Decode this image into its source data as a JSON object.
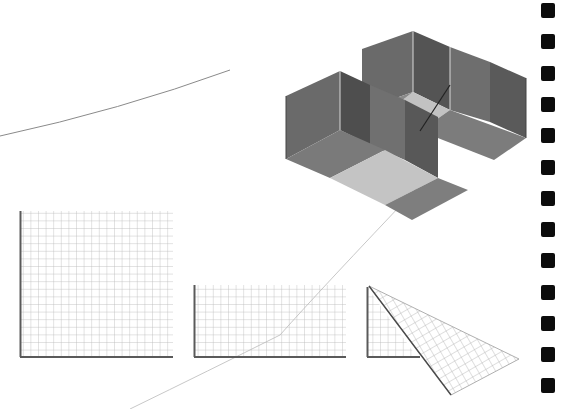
{
  "page": {
    "background": "#ffffff"
  },
  "illustrations": {
    "kite": {
      "label": "box-kite",
      "fill_dark": "#5e5e5e",
      "fill_mid": "#7b7b7b",
      "fill_light": "#b9b9b9"
    },
    "panels": [
      {
        "shape": "square",
        "x": 20,
        "y": 211,
        "w": 153,
        "h": 146,
        "cols": 20,
        "rows": 19
      },
      {
        "shape": "rectangle",
        "x": 194,
        "y": 285,
        "w": 152,
        "h": 72,
        "cols": 20,
        "rows": 9
      },
      {
        "shape": "folded-triangle",
        "x": 367,
        "y": 285,
        "w": 152,
        "h": 110
      }
    ]
  },
  "binding": {
    "hole_color": "#0c0c0c",
    "hole_count": 13,
    "first_y": 3,
    "spacing": 31.3
  }
}
